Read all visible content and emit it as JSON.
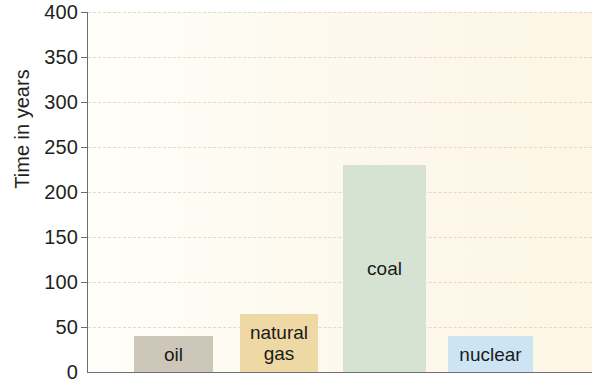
{
  "chart_data": {
    "type": "bar",
    "title": "",
    "subtitle": "",
    "xlabel": "",
    "ylabel": "Time in years",
    "ylim": [
      0,
      400
    ],
    "ytick_step": 50,
    "yticks": [
      "400",
      "350",
      "300",
      "250",
      "200",
      "150",
      "100",
      "50",
      "0"
    ],
    "grid": "horizontal-dashed",
    "legend": "none",
    "categories": [
      "oil",
      "natural gas",
      "coal",
      "nuclear"
    ],
    "values": [
      40,
      65,
      230,
      40
    ],
    "bars": [
      {
        "label": "oil",
        "value": 40,
        "color": "#cdc7ba",
        "label_color": "#1a1a1a",
        "label_lines": [
          "oil"
        ]
      },
      {
        "label": "natural gas",
        "value": 65,
        "color": "#eed9a4",
        "label_color": "#1a1a1a",
        "label_lines": [
          "natural",
          "gas"
        ]
      },
      {
        "label": "coal",
        "value": 230,
        "color": "#d6e3d3",
        "label_color": "#1a1a1a",
        "label_lines": [
          "coal"
        ]
      },
      {
        "label": "nuclear",
        "value": 40,
        "color": "#cce4f4",
        "label_color": "#1a1a1a",
        "label_lines": [
          "nuclear"
        ]
      }
    ],
    "colors": {
      "plot_background": "#fdf8ec",
      "gridline": "#e2d9c2",
      "axis": "#6e6e6e",
      "text": "#231f20"
    }
  }
}
